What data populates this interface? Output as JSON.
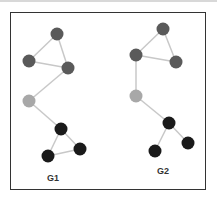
{
  "colors": {
    "edge": "#c8c8c8",
    "dark": "#5a5a5a",
    "black": "#1a1a1a",
    "light": "#a8a8a8",
    "frame": "#333333"
  },
  "graphs": [
    {
      "label": "G1",
      "label_pos": [
        53,
        178
      ],
      "nodes": [
        {
          "id": "a",
          "x": 57,
          "y": 34,
          "color": "dark"
        },
        {
          "id": "b",
          "x": 29,
          "y": 61,
          "color": "dark"
        },
        {
          "id": "c",
          "x": 68,
          "y": 68,
          "color": "dark"
        },
        {
          "id": "d",
          "x": 29,
          "y": 101,
          "color": "light"
        },
        {
          "id": "e",
          "x": 61,
          "y": 129,
          "color": "black"
        },
        {
          "id": "f",
          "x": 80,
          "y": 149,
          "color": "black"
        },
        {
          "id": "g",
          "x": 48,
          "y": 156,
          "color": "black"
        }
      ],
      "edges": [
        [
          "a",
          "b"
        ],
        [
          "a",
          "c"
        ],
        [
          "b",
          "c"
        ],
        [
          "c",
          "d"
        ],
        [
          "d",
          "e"
        ],
        [
          "e",
          "f"
        ],
        [
          "e",
          "g"
        ],
        [
          "f",
          "g"
        ]
      ]
    },
    {
      "label": "G2",
      "label_pos": [
        163,
        171
      ],
      "nodes": [
        {
          "id": "a",
          "x": 163,
          "y": 29,
          "color": "dark"
        },
        {
          "id": "b",
          "x": 136,
          "y": 55,
          "color": "dark"
        },
        {
          "id": "c",
          "x": 176,
          "y": 62,
          "color": "dark"
        },
        {
          "id": "d",
          "x": 136,
          "y": 96,
          "color": "light"
        },
        {
          "id": "e",
          "x": 169,
          "y": 123,
          "color": "black"
        },
        {
          "id": "f",
          "x": 188,
          "y": 143,
          "color": "black"
        },
        {
          "id": "g",
          "x": 155,
          "y": 151,
          "color": "black"
        }
      ],
      "edges": [
        [
          "a",
          "b"
        ],
        [
          "a",
          "c"
        ],
        [
          "b",
          "c"
        ],
        [
          "b",
          "d"
        ],
        [
          "d",
          "e"
        ],
        [
          "e",
          "f"
        ],
        [
          "e",
          "g"
        ]
      ]
    }
  ]
}
